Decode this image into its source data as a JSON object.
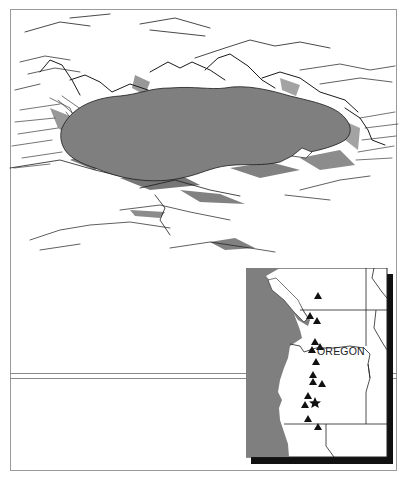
{
  "figure": {
    "illustration": {
      "subject": "crater-lake-sketch",
      "lake_fill": "#7f7f7f",
      "ink": "#1a1a1a"
    },
    "inset_map": {
      "state_label": "OREGON",
      "ocean_fill": "#7f7f7f",
      "land_fill": "#ffffff",
      "shadow_color": "#111111",
      "markers": {
        "volcano_icon": "triangle",
        "featured_icon": "star",
        "volcano_count": 14,
        "featured_count": 1
      }
    }
  }
}
